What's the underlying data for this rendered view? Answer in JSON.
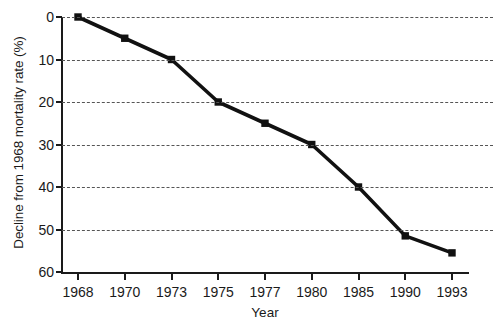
{
  "chart_data": {
    "type": "line",
    "title": "",
    "xlabel": "Year",
    "ylabel": "Decline from 1968 mortality rate (%)",
    "categories": [
      "1968",
      "1970",
      "1973",
      "1975",
      "1977",
      "1980",
      "1985",
      "1990",
      "1993"
    ],
    "values": [
      0,
      5,
      10,
      20,
      25,
      30,
      40,
      51.5,
      55.5
    ],
    "series": [
      {
        "name": "Decline from 1968 mortality rate",
        "values": [
          0,
          5,
          10,
          20,
          25,
          30,
          40,
          51.5,
          55.5
        ]
      }
    ],
    "ylim": [
      0,
      60
    ],
    "y_inverted": true,
    "yticks": [
      0,
      10,
      20,
      30,
      40,
      50,
      60
    ],
    "ytick_labels": [
      "0",
      "10",
      "20",
      "30",
      "40",
      "50",
      "60"
    ],
    "xtick_labels": [
      "1968",
      "1970",
      "1973",
      "1975",
      "1977",
      "1980",
      "1985",
      "1990",
      "1993"
    ],
    "x_scale": "categorical",
    "grid": "horizontal-dashed",
    "legend": "none",
    "marker": "square",
    "line_color": "#111111",
    "marker_color": "#111111",
    "grid_color": "#555555",
    "background_color": "#ffffff"
  }
}
